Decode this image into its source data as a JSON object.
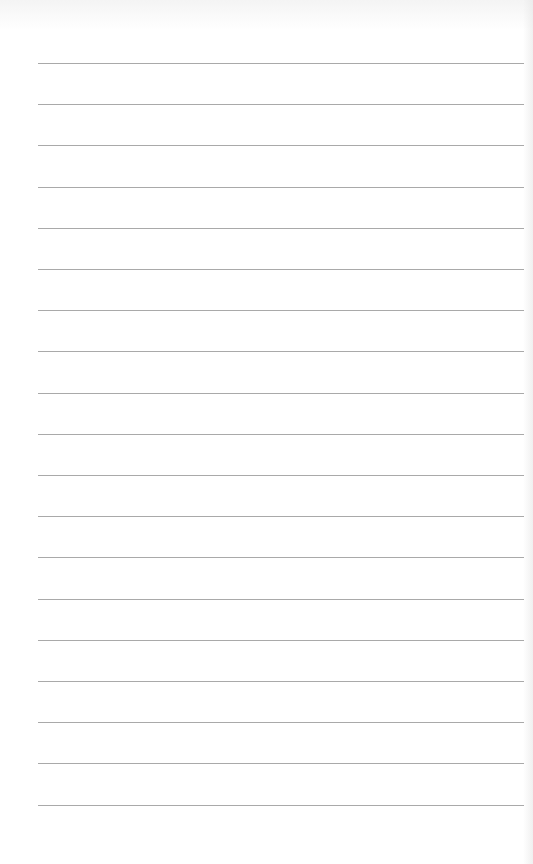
{
  "page": {
    "type": "blank lined paper",
    "background_color": "#ffffff",
    "line_color": "#9a9a9a",
    "line_count": 19,
    "first_line_y": 63,
    "line_spacing": 41.2,
    "line_left": 38,
    "line_right": 524
  }
}
